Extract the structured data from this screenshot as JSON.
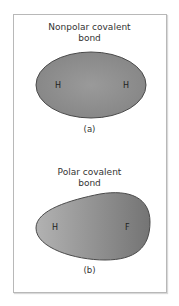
{
  "panels": [
    {
      "id": "a",
      "title_line1": "Nonpolar covalent",
      "title_line2": "bond",
      "caption": "(a)",
      "atoms": [
        "H",
        "H"
      ],
      "shape": "symmetric-ellipse",
      "fill": "#8e8e8e"
    },
    {
      "id": "b",
      "title_line1": "Polar covalent",
      "title_line2": "bond",
      "caption": "(b)",
      "atoms": [
        "H",
        "F"
      ],
      "shape": "teardrop-shifted-to-F",
      "fill_light": "#b0b0b0",
      "fill_dark": "#7a7a7a"
    }
  ]
}
